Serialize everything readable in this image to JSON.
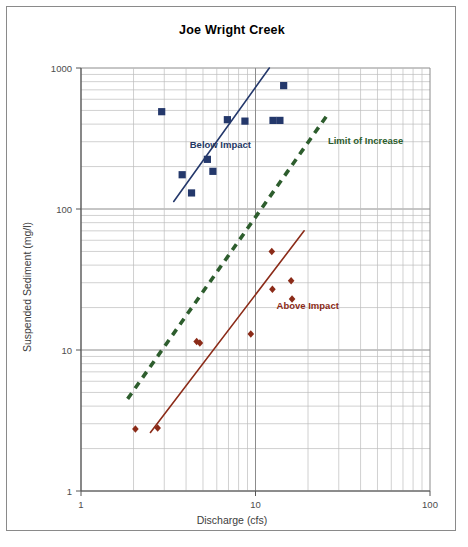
{
  "chart_data": {
    "type": "scatter",
    "title": "Joe Wright Creek",
    "xlabel": "Discharge (cfs)",
    "ylabel": "Suspended Sediment (mg/l)",
    "xscale": "log",
    "yscale": "log",
    "xlim": [
      1,
      100
    ],
    "ylim": [
      1,
      1000
    ],
    "xticks": [
      "1",
      "10",
      "100"
    ],
    "yticks": [
      "1",
      "10",
      "100",
      "1000"
    ],
    "grid": true,
    "grid_minor": true,
    "legend": "inline-annotations",
    "series": [
      {
        "name": "Below Impact",
        "marker": "square",
        "color": "#24386b",
        "label_color": "#1f3864",
        "points": [
          {
            "x": 2.9,
            "y": 490
          },
          {
            "x": 3.8,
            "y": 175
          },
          {
            "x": 4.3,
            "y": 130
          },
          {
            "x": 5.3,
            "y": 225
          },
          {
            "x": 5.7,
            "y": 185
          },
          {
            "x": 6.9,
            "y": 430
          },
          {
            "x": 8.7,
            "y": 420
          },
          {
            "x": 12.6,
            "y": 425
          },
          {
            "x": 13.8,
            "y": 425
          },
          {
            "x": 14.5,
            "y": 750
          }
        ],
        "trend_line": {
          "x1": 3.4,
          "y1": 113,
          "x2": 12.0,
          "y2": 1000
        }
      },
      {
        "name": "Above Impact",
        "marker": "diamond",
        "color": "#8b2b18",
        "label_color": "#8b2b18",
        "points": [
          {
            "x": 2.05,
            "y": 2.75
          },
          {
            "x": 2.75,
            "y": 2.8
          },
          {
            "x": 4.6,
            "y": 11.5
          },
          {
            "x": 4.8,
            "y": 11.2
          },
          {
            "x": 9.4,
            "y": 13.0
          },
          {
            "x": 12.4,
            "y": 50.0
          },
          {
            "x": 12.5,
            "y": 27.0
          },
          {
            "x": 16.0,
            "y": 31.0
          },
          {
            "x": 16.2,
            "y": 23.0
          }
        ],
        "trend_line": {
          "x1": 2.5,
          "y1": 2.6,
          "x2": 19.0,
          "y2": 70
        }
      },
      {
        "name": "Limit of Increase",
        "marker": "none",
        "color": "#2d5d2d",
        "label_color": "#2d5d2d",
        "style": "dashed",
        "trend_line": {
          "x1": 1.85,
          "y1": 4.5,
          "x2": 25.5,
          "y2": 455
        }
      }
    ],
    "annotations": [
      {
        "text": "Below Impact",
        "x": 4.2,
        "y": 270,
        "color": "#1f3864"
      },
      {
        "text": "Above Impact",
        "x": 13.2,
        "y": 19.5,
        "color": "#8b2b18"
      },
      {
        "text": "Limit of Increase",
        "x": 26.0,
        "y": 290,
        "color": "#2d5d2d"
      }
    ]
  }
}
